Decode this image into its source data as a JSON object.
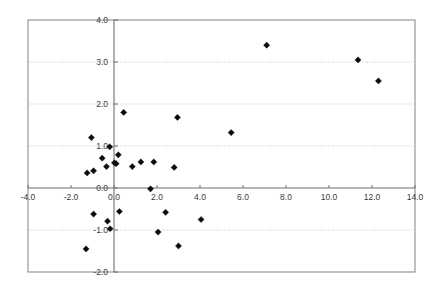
{
  "chart_data": {
    "type": "scatter",
    "title": "",
    "subtitle": "",
    "xlabel": "",
    "ylabel": "",
    "xlim": [
      -4.0,
      14.0
    ],
    "ylim": [
      -2.0,
      4.0
    ],
    "xticks": [
      -4.0,
      -2.0,
      0.0,
      2.0,
      4.0,
      6.0,
      8.0,
      10.0,
      12.0,
      14.0
    ],
    "yticks": [
      -2.0,
      -1.0,
      0.0,
      1.0,
      2.0,
      3.0,
      4.0
    ],
    "xtick_labels": [
      "-4.0",
      "-2.0",
      "0.0",
      "2.0",
      "4.0",
      "6.0",
      "8.0",
      "10.0",
      "12.0",
      "14.0"
    ],
    "ytick_labels": [
      "-2.0",
      "-1.0",
      "0.0",
      "1.0",
      "2.0",
      "3.0",
      "4.0"
    ],
    "grid": true,
    "grid_axis": "y",
    "grid_style": "dotted",
    "legend": false,
    "legend_position": "none",
    "marker": "diamond",
    "marker_color": "#0b0b0b",
    "marker_size": 5,
    "series": [
      {
        "name": "observations",
        "points": [
          [
            -1.3,
            -1.45
          ],
          [
            -1.25,
            0.36
          ],
          [
            -1.05,
            1.2
          ],
          [
            -0.95,
            0.41
          ],
          [
            -0.95,
            -0.62
          ],
          [
            -0.55,
            0.71
          ],
          [
            -0.35,
            0.51
          ],
          [
            -0.3,
            -0.79
          ],
          [
            -0.2,
            0.98
          ],
          [
            -0.18,
            -0.97
          ],
          [
            0.02,
            0.6
          ],
          [
            0.1,
            0.58
          ],
          [
            0.2,
            0.79
          ],
          [
            0.25,
            -0.56
          ],
          [
            0.45,
            1.8
          ],
          [
            0.85,
            0.51
          ],
          [
            1.25,
            0.62
          ],
          [
            1.7,
            -0.02
          ],
          [
            1.85,
            0.62
          ],
          [
            2.05,
            -1.05
          ],
          [
            2.4,
            -0.58
          ],
          [
            2.8,
            0.49
          ],
          [
            2.95,
            1.68
          ],
          [
            3.0,
            -1.38
          ],
          [
            4.05,
            -0.75
          ],
          [
            5.45,
            1.32
          ],
          [
            7.1,
            3.4
          ],
          [
            11.35,
            3.05
          ],
          [
            12.3,
            2.55
          ]
        ]
      }
    ]
  },
  "plot": {
    "frame": {
      "left": 28,
      "top": 20,
      "right": 415,
      "bottom": 272
    },
    "origin": {
      "x_px": 114,
      "y_px": 188
    },
    "scale": {
      "x_px_per_unit": 21.5,
      "y_px_per_unit": 42.0
    }
  }
}
